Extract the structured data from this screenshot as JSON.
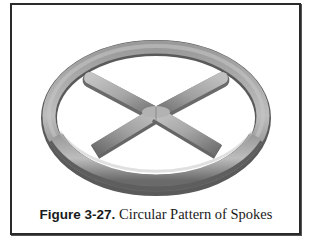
{
  "figure": {
    "label": "Figure 3-27.",
    "title": " Circular Pattern of Spokes",
    "image_description": "Shaded 3D model of a toroidal ring with four cylindrical spokes meeting at center",
    "colors": {
      "border": "#2a2a2a",
      "ring_light": "#b8b8b8",
      "ring_mid": "#909090",
      "ring_dark": "#5c5c5c",
      "spoke_light": "#b4b4b4",
      "spoke_dark": "#6e6e6e"
    }
  }
}
